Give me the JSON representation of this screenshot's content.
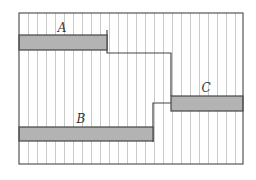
{
  "diagram": {
    "frame": {
      "x": 19,
      "y": 13,
      "width": 224,
      "height": 151,
      "stroke": "#555555"
    },
    "stripes": {
      "spacing": 9,
      "color": "#bdbdbd"
    },
    "bar_fill": "#b3b3b3",
    "bar_stroke": "#444444",
    "bars": [
      {
        "id": "A",
        "label": "A",
        "x": 19,
        "y": 35,
        "width": 88,
        "height": 15,
        "label_x": 62,
        "label_y": 32
      },
      {
        "id": "B",
        "label": "B",
        "x": 19,
        "y": 127,
        "width": 134,
        "height": 14,
        "label_x": 81,
        "label_y": 123
      },
      {
        "id": "C",
        "label": "C",
        "x": 171,
        "y": 96,
        "width": 72,
        "height": 15,
        "label_x": 206,
        "label_y": 92
      }
    ],
    "connectors": [
      {
        "from": "A",
        "to": "C",
        "points": "107,30 107,53 171,53 171,96"
      },
      {
        "from": "B",
        "to": "C",
        "points": "153,142 153,103 171,103"
      }
    ]
  }
}
